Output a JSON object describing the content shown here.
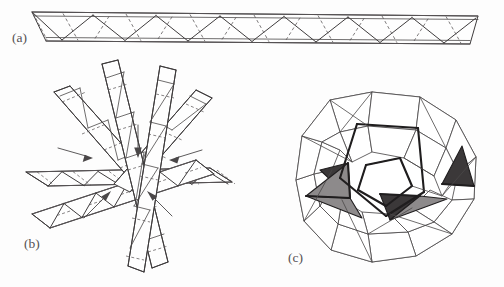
{
  "figure": {
    "background_color": "#fdfdfd",
    "width": 504,
    "height": 287,
    "panels": [
      {
        "id": "a",
        "label": "(a)",
        "label_x": 12,
        "label_y": 42,
        "caption": "Straight triangulated strip with dashed fold creases",
        "geometry": {
          "type": "zigzag-strip",
          "top_rail_left": [
            32,
            12
          ],
          "top_rail_right": [
            478,
            16
          ],
          "bottom_rail_left": [
            46,
            41
          ],
          "bottom_rail_right": [
            470,
            44
          ],
          "zigzag_period": 64,
          "vertex_count": 15,
          "dash_count": 14
        },
        "colors": {
          "solid_stroke": "#3f3c3d",
          "dashed_stroke": "#5d595b",
          "fill": "#fefefe"
        }
      },
      {
        "id": "b",
        "label": "(b)",
        "label_x": 24,
        "label_y": 248,
        "caption": "Five strips woven together, arrows indicate the closing direction",
        "geometry": {
          "type": "woven-star",
          "center": [
            118,
            170
          ],
          "strip_count": 5,
          "arm_count": 10,
          "arrow_count": 5,
          "arrow_directions": [
            "down",
            "left",
            "right",
            "up-right",
            "up-left"
          ]
        },
        "colors": {
          "solid_stroke": "#3f3c3d",
          "dashed_stroke": "#5d595b",
          "arrow_stroke": "#4a4748"
        }
      },
      {
        "id": "c",
        "label": "(c)",
        "label_x": 288,
        "label_y": 262,
        "caption": "Resulting woven polyhedron with shaded faces",
        "geometry": {
          "type": "woven-polyhedron",
          "center": [
            388,
            185
          ],
          "radius": 92,
          "outer_vertices": 12,
          "shaded_dark_faces": 3,
          "shaded_mid_faces": 3
        },
        "colors": {
          "face_dark": "#3b3839",
          "face_mid": "#8d8a8b",
          "face_white": "#ffffff",
          "edge": "#4d4a4b",
          "edge_bold": "#1f1d1e"
        }
      }
    ]
  }
}
